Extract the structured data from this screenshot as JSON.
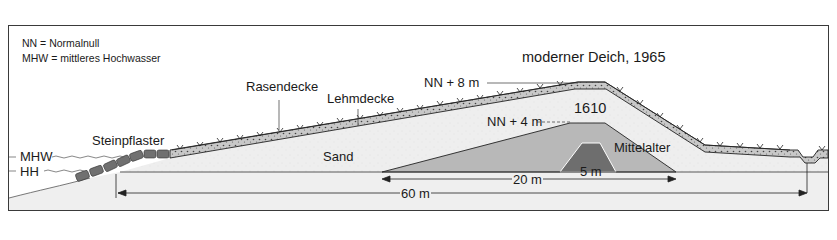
{
  "legend": {
    "nn": "NN = Normalnull",
    "mhw": "MHW = mittleres Hochwasser"
  },
  "title": "moderner Deich, 1965",
  "labels": {
    "nn8": "NN + 8 m",
    "nn4": "NN + 4 m",
    "year1610": "1610",
    "mittelalter": "Mittelalter",
    "rasendecke": "Rasendecke",
    "lehmdecke": "Lehmdecke",
    "steinpflaster": "Steinpflaster",
    "sand": "Sand",
    "mhw": "MHW",
    "hh": "HH"
  },
  "dimensions": {
    "medieval_width": "5 m",
    "dike1610_width": "20 m",
    "modern_width": "60 m"
  },
  "colors": {
    "sand": "#ececec",
    "clay_layer": "#c9c9c9",
    "dike1610": "#b5b5b5",
    "medieval": "#6e6e6e",
    "stones": "#707070",
    "line": "#1e1e1e"
  }
}
